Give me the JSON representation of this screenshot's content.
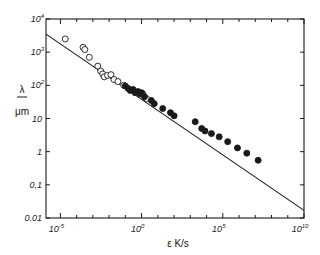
{
  "chart_data": {
    "type": "scatter",
    "title": "",
    "xlabel": "ε  K/s",
    "ylabel": "λ μm",
    "ylabel_parts": [
      "λ",
      "μm"
    ],
    "xscale": "log",
    "yscale": "log",
    "xlim": [
      1.3e-06,
      10000000000.0
    ],
    "ylim": [
      0.01,
      10000
    ],
    "grid": false,
    "legend": null,
    "x_ticks": [
      {
        "exp": "-5",
        "value": 1e-05
      },
      {
        "exp": "0",
        "value": 1
      },
      {
        "exp": "5",
        "value": 100000
      },
      {
        "exp": "10",
        "value": 10000000000
      }
    ],
    "y_ticks": [
      {
        "label": "10",
        "exp": "4",
        "value": 10000
      },
      {
        "label": "10",
        "exp": "3",
        "value": 1000
      },
      {
        "label": "10",
        "exp": "2",
        "value": 100
      },
      {
        "label": "10",
        "exp": "",
        "value": 10
      },
      {
        "label": "1",
        "exp": "",
        "value": 1
      },
      {
        "label": "0,1",
        "exp": "",
        "value": 0.1
      },
      {
        "label": "0.01",
        "exp": "",
        "value": 0.01
      }
    ],
    "series": [
      {
        "name": "open circles",
        "marker": "open-circle",
        "points": [
          {
            "x": 2e-05,
            "y": 2500
          },
          {
            "x": 0.00025,
            "y": 1400
          },
          {
            "x": 0.00032,
            "y": 1200
          },
          {
            "x": 0.0006,
            "y": 700
          },
          {
            "x": 0.002,
            "y": 380
          },
          {
            "x": 0.003,
            "y": 270
          },
          {
            "x": 0.004,
            "y": 220
          },
          {
            "x": 0.005,
            "y": 180
          },
          {
            "x": 0.008,
            "y": 200
          },
          {
            "x": 0.013,
            "y": 210
          },
          {
            "x": 0.02,
            "y": 150
          },
          {
            "x": 0.035,
            "y": 130
          },
          {
            "x": 0.08,
            "y": 100
          },
          {
            "x": 1.2,
            "y": 55
          },
          {
            "x": 2.0,
            "y": 40
          }
        ]
      },
      {
        "name": "filled circles",
        "marker": "filled-circle",
        "points": [
          {
            "x": 0.1,
            "y": 95
          },
          {
            "x": 0.15,
            "y": 80
          },
          {
            "x": 0.2,
            "y": 70
          },
          {
            "x": 0.3,
            "y": 75
          },
          {
            "x": 0.4,
            "y": 60
          },
          {
            "x": 0.6,
            "y": 65
          },
          {
            "x": 0.8,
            "y": 55
          },
          {
            "x": 1.0,
            "y": 60
          },
          {
            "x": 1.5,
            "y": 45
          },
          {
            "x": 4.0,
            "y": 35
          },
          {
            "x": 6.0,
            "y": 28
          },
          {
            "x": 20,
            "y": 20
          },
          {
            "x": 60,
            "y": 15
          },
          {
            "x": 100,
            "y": 12
          },
          {
            "x": 2000,
            "y": 8
          },
          {
            "x": 5000,
            "y": 5
          },
          {
            "x": 8000,
            "y": 4.2
          },
          {
            "x": 20000,
            "y": 3.5
          },
          {
            "x": 60000,
            "y": 2.8
          },
          {
            "x": 200000,
            "y": 2.0
          },
          {
            "x": 800000,
            "y": 1.3
          },
          {
            "x": 3000000,
            "y": 0.9
          },
          {
            "x": 15000000,
            "y": 0.55
          }
        ]
      }
    ],
    "fit_line": {
      "name": "power-law fit",
      "points": [
        {
          "x": 1.3e-06,
          "y": 3500
        },
        {
          "x": 10000000000.0,
          "y": 0.017
        }
      ]
    }
  },
  "colors": {
    "ink": "#1a1a1a",
    "background": "#ffffff"
  }
}
